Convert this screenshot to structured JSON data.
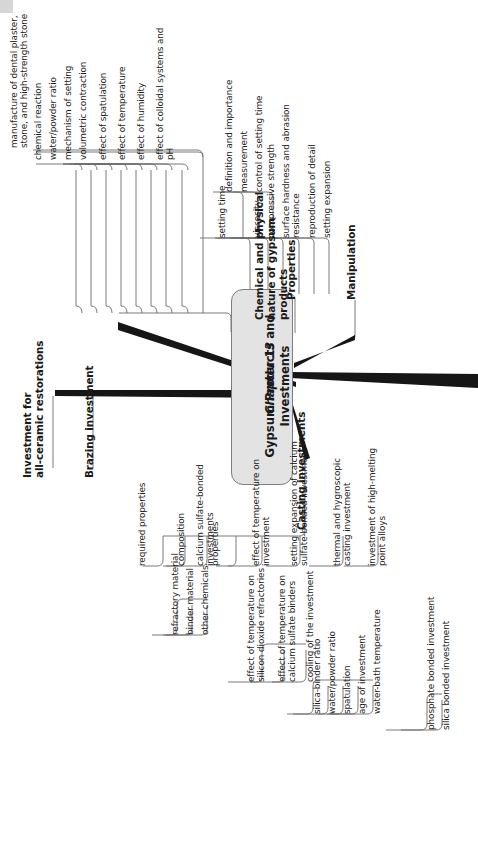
{
  "meta": {
    "orientation": "rotated-90-ccw",
    "background": "#ffffff",
    "center_fill": "#e3e3e3",
    "center_stroke": "#7d7d7d",
    "line_color": "#6b6b6b",
    "text_color": "#1a1a1a"
  },
  "center": {
    "line1": "Chapter 13",
    "line2": "Gypsum Products and",
    "line3": "Investments"
  },
  "branches": {
    "chemical": {
      "label": "Chemical and physical\nnature of gypsum\nproducts",
      "children": [
        "manufacture of dental plaster,\nstone, and high-strength stone",
        "chemical reaction",
        "water/powder ratio",
        "mechanism of setting",
        "volumetric contraction",
        "effect of spatulation",
        "effect of temperature",
        "effect of humidity",
        "effect of colloidal systems and\npH"
      ]
    },
    "properties": {
      "label": "Properties",
      "children": [
        {
          "label": "setting time",
          "children": [
            "definition and importance",
            "measurement",
            "control of setting time"
          ]
        },
        {
          "label": "viscosity",
          "children": []
        },
        {
          "label": "compressive strength",
          "children": []
        },
        {
          "label": "surface hardness and abrasion\nresistance",
          "children": []
        },
        {
          "label": "reproduction of detail",
          "children": []
        },
        {
          "label": "setting expansion",
          "children": []
        }
      ]
    },
    "manipulation": {
      "label": "Manipulation",
      "children": []
    },
    "investment_all_ceramic": {
      "label": "Investment for\nall-ceramic restorations",
      "children": []
    },
    "brazing": {
      "label": "Brazing investment",
      "children": []
    },
    "casting": {
      "label": "Casting investments",
      "children": [
        {
          "label": "required properties",
          "children": []
        },
        {
          "label": "composition",
          "children": [
            "refractory material",
            "binder material",
            "other chemicals"
          ]
        },
        {
          "label": "calcium sulfate-bonded\ninvestments",
          "children": []
        },
        {
          "label": "properties",
          "children": []
        },
        {
          "label": "effect of temperature on\ninvestment",
          "children": [
            "effect of temperature on\nsilicon dioxide refractories",
            "effect of temperature on\ncalcium sulfate binders",
            "cooling of the investment"
          ]
        },
        {
          "label": "setting expansion of calcium\nsulfate-bonded investment",
          "children": [
            "silica-binder ratio",
            "water/powder ratio",
            "spatulation",
            "age of investment",
            "water-bath temperature"
          ]
        },
        {
          "label": "thermal and hygroscopic\ncasting investment",
          "children": []
        },
        {
          "label": "investment of high-melting\npoint alloys",
          "children": [
            "phosphate bonded investment",
            "silica bonded investment"
          ]
        }
      ]
    }
  }
}
